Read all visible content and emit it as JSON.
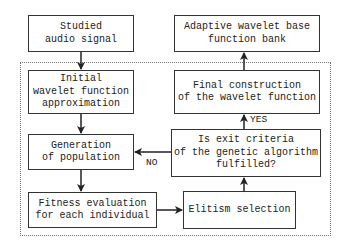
{
  "nodes": {
    "input": "Studied\naudio signal",
    "init": "Initial\nwavelet function\napproximation",
    "generation": "Generation\nof population",
    "fitness": "Fitness evaluation\nfor each individual",
    "elitism": "Elitism selection",
    "exit": "Is exit criteria\nof the genetic algorithm\nfulfilled?",
    "final": "Final construction\nof the wavelet function",
    "bank": "Adaptive wavelet base\nfunction bank"
  },
  "edges": {
    "yes_label": "YES",
    "no_label": "NO"
  }
}
